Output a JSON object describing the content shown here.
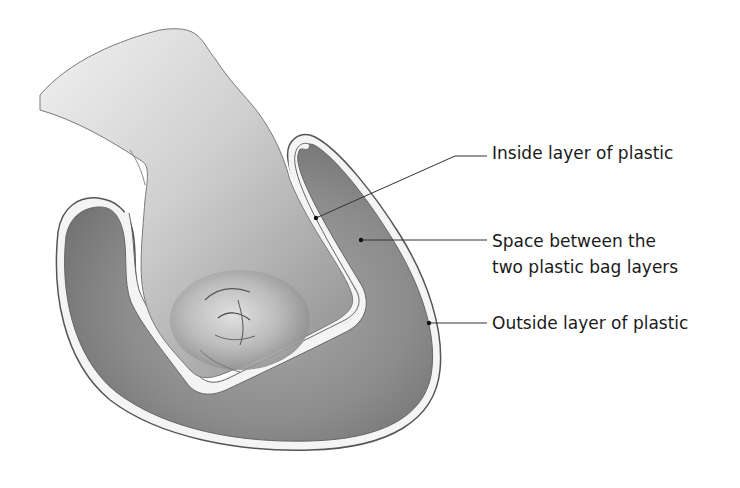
{
  "diagram": {
    "labels": {
      "inside_layer": "Inside layer of plastic",
      "space_line1": "Space between the",
      "space_line2": "two plastic bag layers",
      "outside_layer": "Outside layer of plastic"
    },
    "colors": {
      "bag_fill": "#8f8f8f",
      "bag_edge": "#555555",
      "plastic_film": "#f4f4f4",
      "skin_light": "#dcdcdc",
      "skin_dark": "#9a9a9a",
      "leader_line": "#333333"
    }
  }
}
